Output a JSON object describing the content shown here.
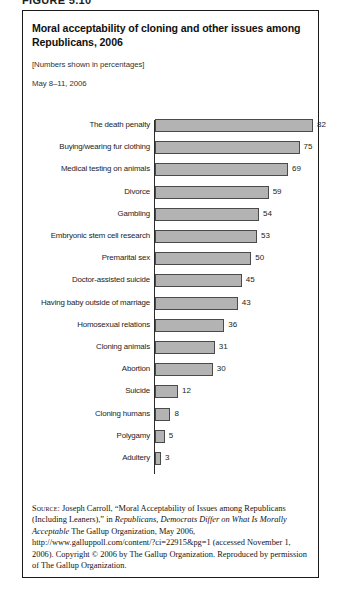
{
  "figure": {
    "running_head": "FIGURE 5.10"
  },
  "header": {
    "title": "Moral acceptability of cloning and other issues among Republicans, 2006",
    "subtitle": "[Numbers shown in percentages]",
    "date_range": "May 8–11, 2006"
  },
  "chart_data": {
    "type": "bar",
    "orientation": "horizontal",
    "title": "Moral acceptability of cloning and other issues among Republicans, 2006",
    "subtitle": "[Numbers shown in percentages]",
    "xlabel": "",
    "ylabel": "",
    "xlim": [
      0,
      90
    ],
    "grid": false,
    "legend": false,
    "units": "percent",
    "categories": [
      "The death penalty",
      "Buying/wearing fur clothing",
      "Medical testing on animals",
      "Divorce",
      "Gambling",
      "Embryonic stem cell research",
      "Premarital sex",
      "Doctor-assisted suicide",
      "Having baby outside of marriage",
      "Homosexual relations",
      "Cloning animals",
      "Abortion",
      "Suicide",
      "Cloning humans",
      "Polygamy",
      "Adultery"
    ],
    "values": [
      82,
      75,
      69,
      59,
      54,
      53,
      50,
      45,
      43,
      36,
      31,
      30,
      12,
      8,
      5,
      3
    ],
    "bar_fill": "#b3b3b3",
    "bar_stroke": "#4a4a4a"
  },
  "source": {
    "label": "Source:",
    "text_1": " Joseph Carroll, “Moral Acceptability of Issues among Republicans (Including Leaners),” in ",
    "italic_1": "Republicans, Democrats Differ on What Is Morally Acceptable",
    "text_2": " The Gallup Organization, May 2006, http://www.galluppoll.com/content/?ci=22915&pg=1 (accessed November 1, 2006). Copyright © 2006 by The Gallup Organization. Reproduced by permission of The Gallup Organization."
  }
}
